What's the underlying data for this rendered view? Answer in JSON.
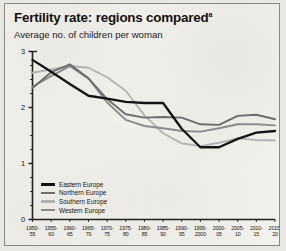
{
  "figure": {
    "title": "Fertility rate: regions compared",
    "title_footnote": "a",
    "subtitle": "Average no. of children per woman"
  },
  "chart_data": {
    "type": "line",
    "title": "Fertility rate: regions compared",
    "subtitle": "Average no. of children per woman",
    "xlabel": "",
    "ylabel": "Average no. of children per woman",
    "ylim": [
      0,
      3
    ],
    "yticks": [
      "0",
      "1",
      "2",
      "3"
    ],
    "grid": false,
    "legend_position": "bottom-left",
    "categories": [
      "1950-55",
      "1955-60",
      "1960-65",
      "1965-70",
      "1970-75",
      "1975-80",
      "1980-85",
      "1985-90",
      "1990-95",
      "1995-2000",
      "2000-05",
      "2005-10",
      "2010-15",
      "2015-20"
    ],
    "xtick_lines": [
      [
        "1950-",
        "55"
      ],
      [
        "1955-",
        "60"
      ],
      [
        "1960-",
        "65"
      ],
      [
        "1965-",
        "70"
      ],
      [
        "1970-",
        "75"
      ],
      [
        "1975-",
        "80"
      ],
      [
        "1980-",
        "85"
      ],
      [
        "1985-",
        "90"
      ],
      [
        "1990-",
        "95"
      ],
      [
        "1995-",
        "2000"
      ],
      [
        "2000-",
        "05"
      ],
      [
        "2005-",
        "10"
      ],
      [
        "2010-",
        "15"
      ],
      [
        "2015-",
        "20"
      ]
    ],
    "series": [
      {
        "name": "Eastern Europe",
        "color": "#141414",
        "values": [
          2.85,
          2.64,
          2.42,
          2.21,
          2.16,
          2.1,
          2.08,
          2.08,
          1.62,
          1.29,
          1.29,
          1.44,
          1.55,
          1.58
        ]
      },
      {
        "name": "Northern Europe",
        "color": "#6f6f6f",
        "values": [
          2.35,
          2.63,
          2.77,
          2.52,
          2.15,
          1.88,
          1.82,
          1.83,
          1.82,
          1.7,
          1.69,
          1.85,
          1.87,
          1.79
        ]
      },
      {
        "name": "Southern Europe",
        "color": "#b5b5b5",
        "values": [
          2.62,
          2.68,
          2.74,
          2.71,
          2.54,
          2.3,
          1.86,
          1.54,
          1.36,
          1.31,
          1.37,
          1.45,
          1.42,
          1.41
        ]
      },
      {
        "name": "Western Europe",
        "color": "#8e8e8e",
        "values": [
          2.37,
          2.56,
          2.74,
          2.52,
          2.09,
          1.78,
          1.67,
          1.63,
          1.58,
          1.57,
          1.63,
          1.7,
          1.7,
          1.68
        ]
      }
    ]
  },
  "legend": {
    "items": [
      {
        "label": "Eastern Europe",
        "color": "#141414"
      },
      {
        "label": "Northern Europe",
        "color": "#6f6f6f"
      },
      {
        "label": "Southern Europe",
        "color": "#b5b5b5"
      },
      {
        "label": "Western Europe",
        "color": "#8e8e8e"
      }
    ]
  }
}
